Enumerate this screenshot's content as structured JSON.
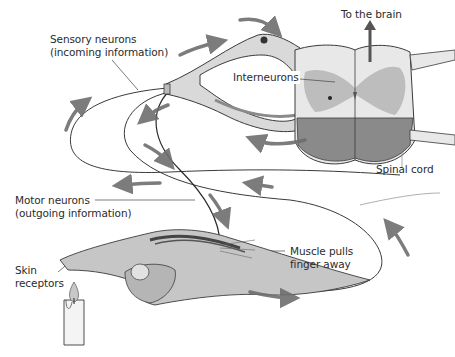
{
  "diagram": {
    "type": "reflex-arc",
    "colors": {
      "background": "#ffffff",
      "outline": "#3a3a3a",
      "nerve_fill": "#d9d9d9",
      "gray_matter": "#bdbdbd",
      "white_matter_light": "#e8e8e8",
      "ventral_dark": "#8a8a8a",
      "arrow": "#6e6e6e",
      "text": "#2b2b2b"
    },
    "labels": {
      "sensory": {
        "line1": "Sensory neurons",
        "line2": "(incoming information)"
      },
      "interneurons": "Interneurons",
      "to_brain": "To the brain",
      "spinal_cord": "Spinal cord",
      "motor": {
        "line1": "Motor neurons",
        "line2": "(outgoing information)"
      },
      "muscle": {
        "line1": "Muscle pulls",
        "line2": "finger away"
      },
      "skin": {
        "line1": "Skin",
        "line2": "receptors"
      }
    },
    "flow_arrows": [
      "up-left-loop",
      "top-over-ganglion",
      "toward-spinal-cord-lower",
      "down-to-motor-1",
      "down-to-motor-2",
      "left-along-loop",
      "right-along-loop",
      "up-right-loop",
      "right-bottom"
    ]
  }
}
